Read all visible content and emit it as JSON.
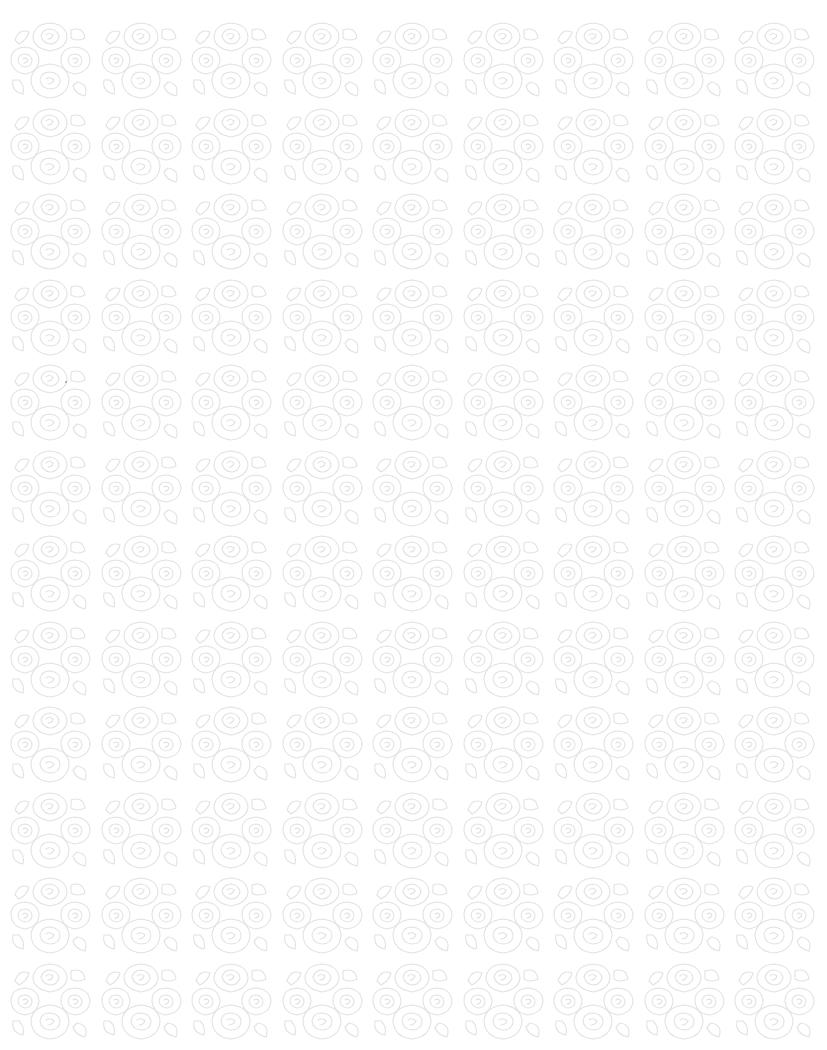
{
  "pattern": {
    "motif": "rose-bouquet-icon",
    "columns": 9,
    "rows": 12,
    "tile_width": 90,
    "tile_height": 85,
    "background_color": "#ffffff",
    "stroke_color": "#e2e2e2"
  }
}
